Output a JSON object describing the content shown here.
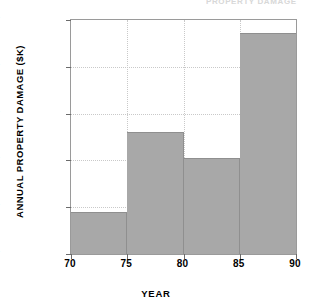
{
  "figure": {
    "clipped_header_text": "PROPERTY DAMAGE",
    "background_color": "#ffffff",
    "bar_color": "#a8a8a8",
    "axis_color": "#9a9a9a",
    "grid_color": "#c9c9c9"
  },
  "chart_data": {
    "type": "bar",
    "title": "",
    "subtitle": "",
    "xlabel": "YEAR",
    "ylabel": "ANNUAL PROPERTY DAMAGE ($K)",
    "xlim": [
      70,
      90
    ],
    "ylim": [
      200,
      700
    ],
    "grid": true,
    "legend": false,
    "legend_position": "none",
    "orientation": "vertical",
    "bin_edges": [
      70,
      75,
      80,
      85,
      90
    ],
    "categories": [
      "70-75",
      "75-80",
      "80-85",
      "85-90"
    ],
    "values": [
      290,
      461,
      406,
      672
    ],
    "xticks": [
      70,
      75,
      80,
      85,
      90
    ],
    "xticklabels": [
      "70",
      "75",
      "80",
      "85",
      "90"
    ],
    "yticks": [
      200,
      300,
      400,
      500,
      600,
      700
    ],
    "yticklabels": [
      "200",
      "300",
      "400",
      "500",
      "600",
      "700"
    ],
    "series": [
      {
        "name": "Annual property damage",
        "values": [
          290,
          461,
          406,
          672
        ]
      }
    ],
    "annotations": []
  }
}
